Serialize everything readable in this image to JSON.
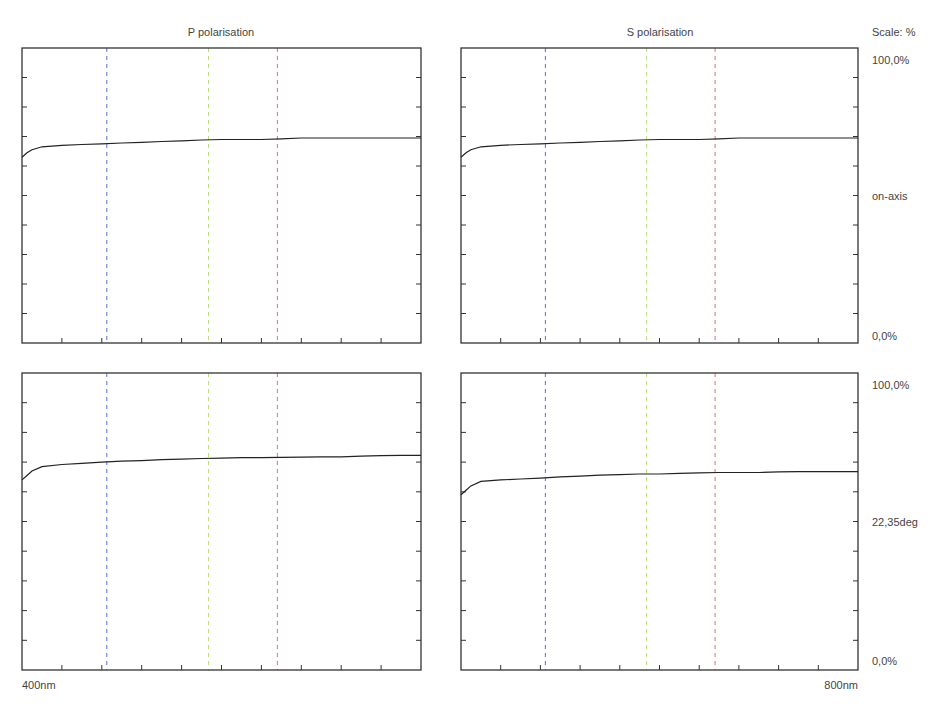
{
  "header": {
    "p_title": "P polarisation",
    "s_title": "S polarisation",
    "scale_label": "Scale: %"
  },
  "right_labels": {
    "top_max": "100,0%",
    "top_mid": "on-axis",
    "top_min": "0,0%",
    "bottom_max": "100,0%",
    "bottom_mid": "22,35deg",
    "bottom_min": "0,0%"
  },
  "x_axis": {
    "min_label": "400nm",
    "max_label": "800nm"
  },
  "colors": {
    "frame": "#333333",
    "curve": "#222222",
    "blue_marker": "#5a6fd0",
    "green_marker": "#b8dc78",
    "red_marker": "#e07070"
  },
  "chart_data": [
    {
      "type": "line",
      "title": "P polarisation",
      "subtitle": "on-axis",
      "xlabel": "Wavelength (nm)",
      "ylabel": "Reflectance (%)",
      "xlim": [
        400,
        800
      ],
      "ylim": [
        0,
        100
      ],
      "x_ticks_every": 40,
      "y_ticks_every": 10,
      "markers_nm": [
        485,
        587,
        656
      ],
      "x": [
        400,
        405,
        410,
        420,
        440,
        460,
        480,
        500,
        520,
        540,
        560,
        580,
        600,
        620,
        640,
        660,
        680,
        700,
        720,
        740,
        760,
        780,
        800
      ],
      "values": [
        63,
        64.5,
        65.5,
        66.5,
        67,
        67.3,
        67.5,
        67.8,
        68,
        68.3,
        68.5,
        68.8,
        69,
        69,
        69,
        69.2,
        69.5,
        69.5,
        69.5,
        69.5,
        69.5,
        69.5,
        69.5
      ]
    },
    {
      "type": "line",
      "title": "S polarisation",
      "subtitle": "on-axis",
      "xlim": [
        400,
        800
      ],
      "ylim": [
        0,
        100
      ],
      "markers_nm": [
        485,
        587,
        656
      ],
      "x": [
        400,
        405,
        410,
        420,
        440,
        460,
        480,
        500,
        520,
        540,
        560,
        580,
        600,
        620,
        640,
        660,
        680,
        700,
        720,
        740,
        760,
        780,
        800
      ],
      "values": [
        63,
        64.5,
        65.5,
        66.5,
        67,
        67.3,
        67.5,
        67.8,
        68,
        68.3,
        68.5,
        68.8,
        69,
        69,
        69,
        69.2,
        69.5,
        69.5,
        69.5,
        69.5,
        69.5,
        69.5,
        69.5
      ]
    },
    {
      "type": "line",
      "title": "P polarisation",
      "subtitle": "22,35deg",
      "xlim": [
        400,
        800
      ],
      "ylim": [
        0,
        100
      ],
      "markers_nm": [
        485,
        587,
        656
      ],
      "x": [
        400,
        405,
        410,
        420,
        440,
        460,
        480,
        500,
        520,
        540,
        560,
        580,
        600,
        620,
        640,
        660,
        680,
        700,
        720,
        740,
        760,
        780,
        800
      ],
      "values": [
        64,
        65.5,
        67,
        68.5,
        69.2,
        69.6,
        70,
        70.3,
        70.5,
        70.8,
        71,
        71.2,
        71.3,
        71.5,
        71.5,
        71.6,
        71.7,
        71.8,
        71.8,
        72,
        72.2,
        72.3,
        72.3
      ]
    },
    {
      "type": "line",
      "title": "S polarisation",
      "subtitle": "22,35deg",
      "xlim": [
        400,
        800
      ],
      "ylim": [
        0,
        100
      ],
      "markers_nm": [
        485,
        587,
        656
      ],
      "x": [
        400,
        405,
        410,
        420,
        440,
        460,
        480,
        500,
        520,
        540,
        560,
        580,
        600,
        620,
        640,
        660,
        680,
        700,
        720,
        740,
        760,
        780,
        800
      ],
      "values": [
        59,
        60.5,
        62,
        63.5,
        64,
        64.3,
        64.6,
        65,
        65.3,
        65.6,
        65.8,
        66,
        66,
        66.2,
        66.4,
        66.5,
        66.5,
        66.5,
        66.7,
        66.8,
        66.8,
        66.8,
        66.8
      ]
    }
  ]
}
